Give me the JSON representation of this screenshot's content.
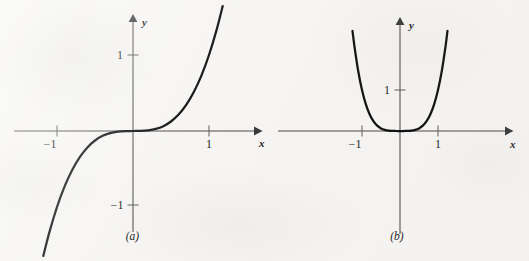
{
  "figure": {
    "background_color": "#f6f5f3",
    "curve_color": "#111111",
    "axis_color": "#4a4a4a"
  },
  "chart_data": [
    {
      "type": "line",
      "panel": "a",
      "caption": "(a)",
      "title": "",
      "function": "y = x^3",
      "xlabel": "x",
      "ylabel": "y",
      "xlim": [
        -1.35,
        1.35
      ],
      "ylim": [
        -1.6,
        1.6
      ],
      "grid": false,
      "legend": null,
      "x_ticks": [
        -1,
        1
      ],
      "x_tick_labels": [
        "-1",
        "1"
      ],
      "y_ticks": [
        -1,
        1
      ],
      "y_tick_labels": [
        "-1",
        "1"
      ],
      "x": [
        -1.18,
        -1.1,
        -1.0,
        -0.9,
        -0.8,
        -0.7,
        -0.6,
        -0.5,
        -0.4,
        -0.3,
        -0.2,
        -0.1,
        0.0,
        0.1,
        0.2,
        0.3,
        0.4,
        0.5,
        0.6,
        0.7,
        0.8,
        0.9,
        1.0,
        1.1,
        1.18
      ],
      "values": [
        -1.643,
        -1.331,
        -1.0,
        -0.729,
        -0.512,
        -0.343,
        -0.216,
        -0.125,
        -0.064,
        -0.027,
        -0.008,
        -0.001,
        0.0,
        0.001,
        0.008,
        0.027,
        0.064,
        0.125,
        0.216,
        0.343,
        0.512,
        0.729,
        1.0,
        1.331,
        1.643
      ]
    },
    {
      "type": "line",
      "panel": "b",
      "caption": "(b)",
      "title": "",
      "function": "y = x^4",
      "xlabel": "x",
      "ylabel": "y",
      "xlim": [
        -1.35,
        1.35
      ],
      "ylim": [
        -1.6,
        1.6
      ],
      "grid": false,
      "legend": null,
      "x_ticks": [
        -1,
        1
      ],
      "x_tick_labels": [
        "-1",
        "1"
      ],
      "y_ticks": [
        1
      ],
      "y_tick_labels": [
        "1"
      ],
      "x": [
        -1.3,
        -1.25,
        -1.2,
        -1.1,
        -1.0,
        -0.9,
        -0.8,
        -0.7,
        -0.6,
        -0.5,
        -0.4,
        -0.3,
        -0.2,
        -0.1,
        0.0,
        0.1,
        0.2,
        0.3,
        0.4,
        0.5,
        0.6,
        0.7,
        0.8,
        0.9,
        1.0,
        1.1,
        1.2,
        1.25,
        1.3
      ],
      "values": [
        2.856,
        2.441,
        2.074,
        1.464,
        1.0,
        0.656,
        0.41,
        0.24,
        0.13,
        0.063,
        0.026,
        0.008,
        0.002,
        0.0001,
        0.0,
        0.0001,
        0.002,
        0.008,
        0.026,
        0.063,
        0.13,
        0.24,
        0.41,
        0.656,
        1.0,
        1.464,
        2.074,
        2.441,
        2.856
      ]
    }
  ],
  "panel_a": {
    "caption": "(a)",
    "x_axis_label": "x",
    "y_axis_label": "y",
    "x_tick_neg1": "−1",
    "x_tick_pos1": "1",
    "y_tick_pos1": "1",
    "y_tick_neg1": "−1"
  },
  "panel_b": {
    "caption": "(b)",
    "x_axis_label": "x",
    "y_axis_label": "y",
    "x_tick_neg1": "−1",
    "x_tick_pos1": "1",
    "y_tick_pos1": "1"
  }
}
